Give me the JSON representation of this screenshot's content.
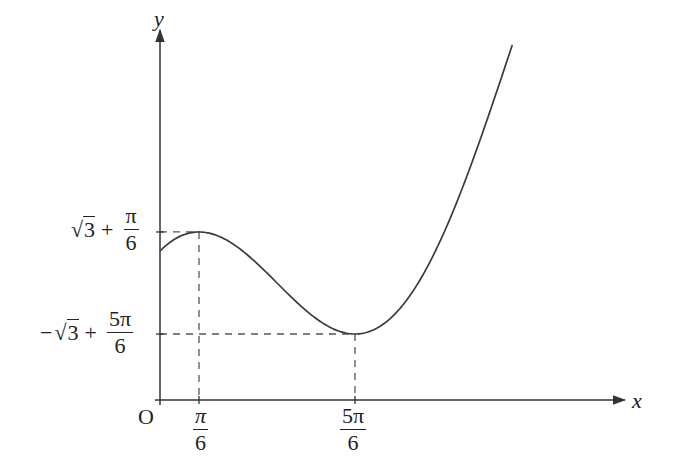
{
  "diagram": {
    "type": "function_graph",
    "function": "y = x + 2cos(x)",
    "axes": {
      "x_label": "x",
      "y_label": "y",
      "origin_label": "O"
    },
    "x_ticks": [
      {
        "name": "pi-over-6",
        "num": "π",
        "den": "6",
        "value": 0.5236
      },
      {
        "name": "5pi-over-6",
        "num": "5π",
        "den": "6",
        "value": 2.618
      }
    ],
    "y_ticks": [
      {
        "name": "local-max-value",
        "prefix": "",
        "root": "3",
        "plus": "+",
        "num": "π",
        "den": "6",
        "value": 2.2556
      },
      {
        "name": "local-min-value",
        "prefix": "−",
        "root": "3",
        "plus": "+",
        "num": "5π",
        "den": "6",
        "value": 0.8859
      }
    ],
    "critical_points": [
      {
        "kind": "local maximum",
        "x": "π/6",
        "y": "√3 + π/6"
      },
      {
        "kind": "local minimum",
        "x": "5π/6",
        "y": "−√3 + 5π/6"
      }
    ],
    "domain": [
      0,
      4.73
    ],
    "colors": {
      "axis": "#333333",
      "curve": "#3a3a3a",
      "dashed": "#555555"
    },
    "geometry": {
      "origin_px": [
        160,
        400
      ],
      "scale_x": 74.48,
      "scale_y": 74.5,
      "x_axis_end": 625,
      "y_axis_top": 30
    }
  }
}
